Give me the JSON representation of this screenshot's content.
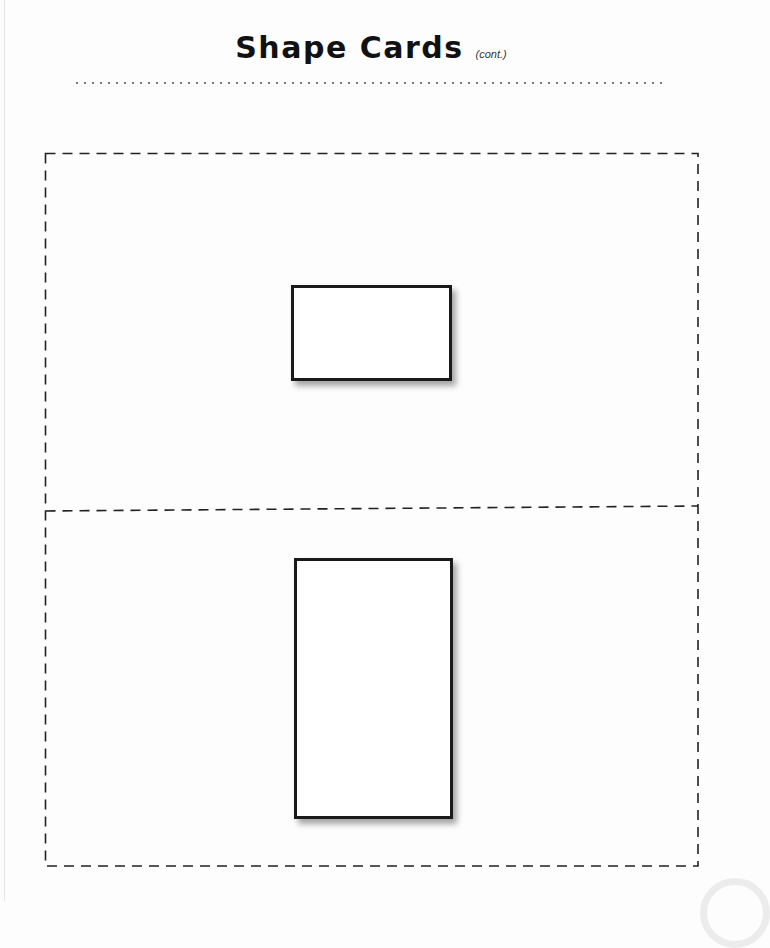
{
  "page": {
    "title": "Shape Cards",
    "title_suffix": "(cont.)",
    "background_color": "#fdfdfd"
  },
  "card_sheet": {
    "border_style": "dashed",
    "cut_line_color": "#222222",
    "cards": [
      {
        "position": "top",
        "shape": "rectangle",
        "orientation": "landscape",
        "outline_color": "#1a1a1a",
        "fill_color": "#ffffff",
        "has_drop_shadow": true
      },
      {
        "position": "bottom",
        "shape": "rectangle",
        "orientation": "portrait",
        "outline_color": "#1a1a1a",
        "fill_color": "#ffffff",
        "has_drop_shadow": true
      }
    ]
  },
  "decorations": {
    "dotted_rule_color": "#777777",
    "watermark": "circle-watermark"
  }
}
